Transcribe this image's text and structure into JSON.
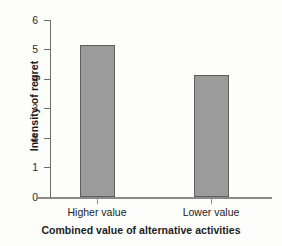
{
  "chart_data": {
    "type": "bar",
    "title": "",
    "categories": [
      "Higher value",
      "Lower value"
    ],
    "values": [
      5.15,
      4.15
    ],
    "xlabel": "Combined value of alternative activities",
    "ylabel": "Intensity of regret",
    "ylim": [
      0,
      6
    ],
    "yticks": [
      0,
      1,
      2,
      3,
      4,
      5,
      6
    ],
    "ytick_labels": [
      "0",
      "1",
      "2",
      "3",
      "4",
      "5",
      "6"
    ],
    "grid": false,
    "legend": false,
    "bar_color": "#9b9b9b",
    "bar_edge_color": "#5e5e5e",
    "axis_color": "#8a8a8a",
    "background_color": "#fdfdfb"
  }
}
